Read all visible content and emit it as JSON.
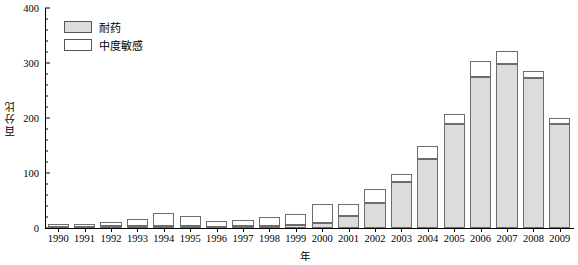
{
  "chart_data": {
    "type": "bar",
    "title": "",
    "subtitle": "",
    "xlabel": "年",
    "ylabel": "百分比",
    "stacked": true,
    "grid": false,
    "legend_position": "top-left",
    "ylim": [
      0,
      400
    ],
    "yticks": [
      0,
      100,
      200,
      300,
      400
    ],
    "yticks_minor_step": 20,
    "categories": [
      "1990",
      "1991",
      "1992",
      "1993",
      "1994",
      "1995",
      "1996",
      "1997",
      "1998",
      "1999",
      "2000",
      "2001",
      "2002",
      "2003",
      "2004",
      "2005",
      "2006",
      "2007",
      "2008",
      "2009"
    ],
    "series": [
      {
        "name": "耐药",
        "color": "#dcdcdc",
        "values": [
          2,
          2,
          3,
          3,
          4,
          3,
          2,
          3,
          4,
          6,
          10,
          22,
          45,
          84,
          125,
          190,
          275,
          298,
          272,
          190
        ]
      },
      {
        "name": "中度敏感",
        "color": "#ffffff",
        "values": [
          6,
          6,
          8,
          14,
          23,
          18,
          10,
          12,
          16,
          20,
          33,
          21,
          26,
          15,
          25,
          18,
          29,
          24,
          14,
          10
        ]
      }
    ],
    "totals": [
      8,
      8,
      11,
      17,
      27,
      21,
      12,
      15,
      20,
      26,
      43,
      43,
      71,
      99,
      150,
      208,
      304,
      322,
      286,
      200
    ]
  },
  "legend": {
    "items": [
      {
        "label": "耐药",
        "swatch": "resist"
      },
      {
        "label": "中度敏感",
        "swatch": "sens"
      }
    ]
  },
  "axes": {
    "y_title": "百分比",
    "x_title": "年",
    "y_tick_labels": [
      "0",
      "100",
      "200",
      "300",
      "400"
    ]
  }
}
